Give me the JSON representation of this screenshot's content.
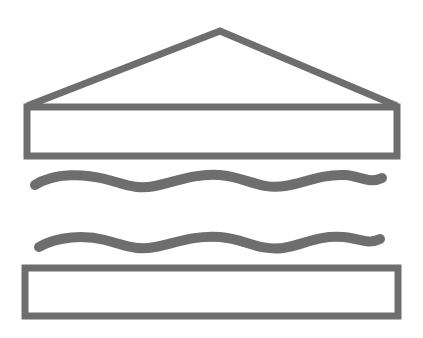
{
  "icon": {
    "name": "shelter-water-icon",
    "stroke_color": "#6e6e6e",
    "background": "#ffffff",
    "parts": [
      "roof",
      "upper-box",
      "wave-1",
      "wave-2",
      "lower-box"
    ]
  }
}
